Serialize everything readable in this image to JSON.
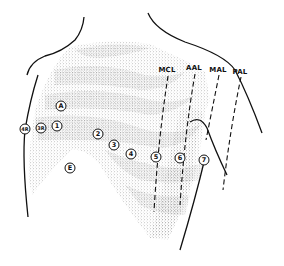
{
  "diagram": {
    "line_labels": [
      {
        "id": "mcl",
        "text": "MCL",
        "x": 167,
        "y": 70
      },
      {
        "id": "aal",
        "text": "AAL",
        "x": 194,
        "y": 68
      },
      {
        "id": "mal",
        "text": "MAL",
        "x": 218,
        "y": 70
      },
      {
        "id": "pal",
        "text": "PAL",
        "x": 240,
        "y": 72
      }
    ],
    "electrodes": [
      {
        "id": "A",
        "text": "A",
        "x": 61,
        "y": 106
      },
      {
        "id": "1",
        "text": "1",
        "x": 57,
        "y": 126
      },
      {
        "id": "3R",
        "text": "3R",
        "x": 41,
        "y": 128
      },
      {
        "id": "4R",
        "text": "4R",
        "x": 25,
        "y": 129
      },
      {
        "id": "2",
        "text": "2",
        "x": 98,
        "y": 134
      },
      {
        "id": "3",
        "text": "3",
        "x": 114,
        "y": 145
      },
      {
        "id": "4",
        "text": "4",
        "x": 131,
        "y": 154
      },
      {
        "id": "5",
        "text": "5",
        "x": 156,
        "y": 157
      },
      {
        "id": "6",
        "text": "6",
        "x": 180,
        "y": 158
      },
      {
        "id": "7",
        "text": "7",
        "x": 204,
        "y": 160
      },
      {
        "id": "E",
        "text": "E",
        "x": 70,
        "y": 168
      }
    ],
    "colors": {
      "ink": "#111111",
      "stipple": "#8a8a8a",
      "background": "#ffffff"
    }
  }
}
